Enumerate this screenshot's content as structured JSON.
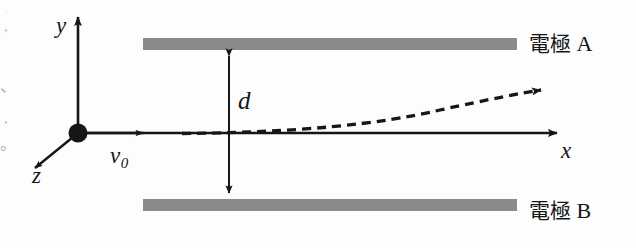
{
  "figure": {
    "background_color": "#fdfdfd",
    "stroke_color": "#161616",
    "plate_color": "#8a8a8a"
  },
  "axes": {
    "y_label": "y",
    "x_label": "x",
    "z_label": "z",
    "origin_marker": "origin-dot"
  },
  "velocity": {
    "symbol": "v",
    "subscript": "0"
  },
  "gap": {
    "label": "d"
  },
  "plates": [
    {
      "name": "electrode-a",
      "label_cjk": "電極",
      "label_letter": "A"
    },
    {
      "name": "electrode-b",
      "label_cjk": "電極",
      "label_letter": "B"
    }
  ],
  "trajectory": {
    "name": "deflected-beam-path",
    "style": "dashed",
    "arrowhead": true
  },
  "edge_artifacts": [
    "・",
    "丶",
    "、",
    "丶",
    "。",
    "［"
  ]
}
